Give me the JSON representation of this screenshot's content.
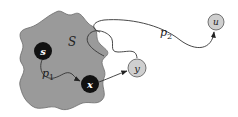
{
  "diagram": {
    "region_label": "S",
    "region_fill": "#9a9a9a",
    "nodes": [
      {
        "id": "s",
        "label": "s",
        "fill": "#111111",
        "text_color": "#ffffff"
      },
      {
        "id": "x",
        "label": "x",
        "fill": "#111111",
        "text_color": "#ffffff"
      },
      {
        "id": "y",
        "label": "y",
        "fill": "#cfcfcf",
        "text_color": "#222222"
      },
      {
        "id": "u",
        "label": "u",
        "fill": "#cfcfcf",
        "text_color": "#222222"
      }
    ],
    "paths": [
      {
        "id": "p1",
        "label": "p",
        "subscript": "1",
        "from": "s",
        "to": "x"
      },
      {
        "id": "p2",
        "label": "p",
        "subscript": "2",
        "from": "S",
        "to": "u"
      },
      {
        "id": "p3",
        "label": "",
        "from": "x",
        "to": "y"
      },
      {
        "id": "p4",
        "label": "",
        "from": "S",
        "to": "y"
      }
    ]
  }
}
